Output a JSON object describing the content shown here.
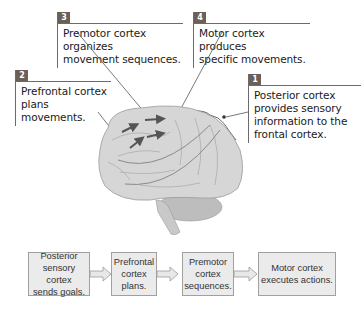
{
  "callouts": [
    {
      "number": "1",
      "text_lines": [
        "Posterior cortex",
        "provides sensory",
        "information to the",
        "frontal cortex."
      ]
    },
    {
      "number": "2",
      "text_lines": [
        "Prefrontal cortex",
        "plans movements."
      ]
    },
    {
      "number": "3",
      "text_lines": [
        "Premotor cortex organizes",
        "movement sequences."
      ]
    },
    {
      "number": "4",
      "text_lines": [
        "Motor cortex produces",
        "specific movements."
      ]
    }
  ],
  "flow": [
    {
      "lines": [
        "Posterior",
        "sensory cortex",
        "sends goals."
      ]
    },
    {
      "lines": [
        "Prefrontal",
        "cortex",
        "plans."
      ]
    },
    {
      "lines": [
        "Premotor",
        "cortex",
        "sequences."
      ]
    },
    {
      "lines": [
        "Motor cortex",
        "executes actions."
      ]
    }
  ],
  "colors": {
    "tab": "#6a6058",
    "rule": "#6b6b6b",
    "flow_fill": "#ebebeb",
    "brain": "#d9d9d9"
  }
}
